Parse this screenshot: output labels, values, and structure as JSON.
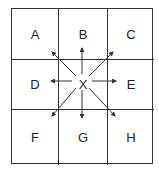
{
  "diagram": {
    "title": "",
    "cells": [
      "A",
      "B",
      "C",
      "D",
      "X",
      "E",
      "F",
      "G",
      "H"
    ],
    "center": "X",
    "arrows": [
      {
        "from": "X",
        "to": "A",
        "direction": "up-left"
      },
      {
        "from": "X",
        "to": "B",
        "direction": "up"
      },
      {
        "from": "X",
        "to": "C",
        "direction": "up-right"
      },
      {
        "from": "X",
        "to": "D",
        "direction": "left"
      },
      {
        "from": "X",
        "to": "E",
        "direction": "right"
      },
      {
        "from": "X",
        "to": "F",
        "direction": "down-left"
      },
      {
        "from": "X",
        "to": "G",
        "direction": "down"
      },
      {
        "from": "X",
        "to": "H",
        "direction": "down-right"
      }
    ],
    "line_color": "#333333"
  }
}
